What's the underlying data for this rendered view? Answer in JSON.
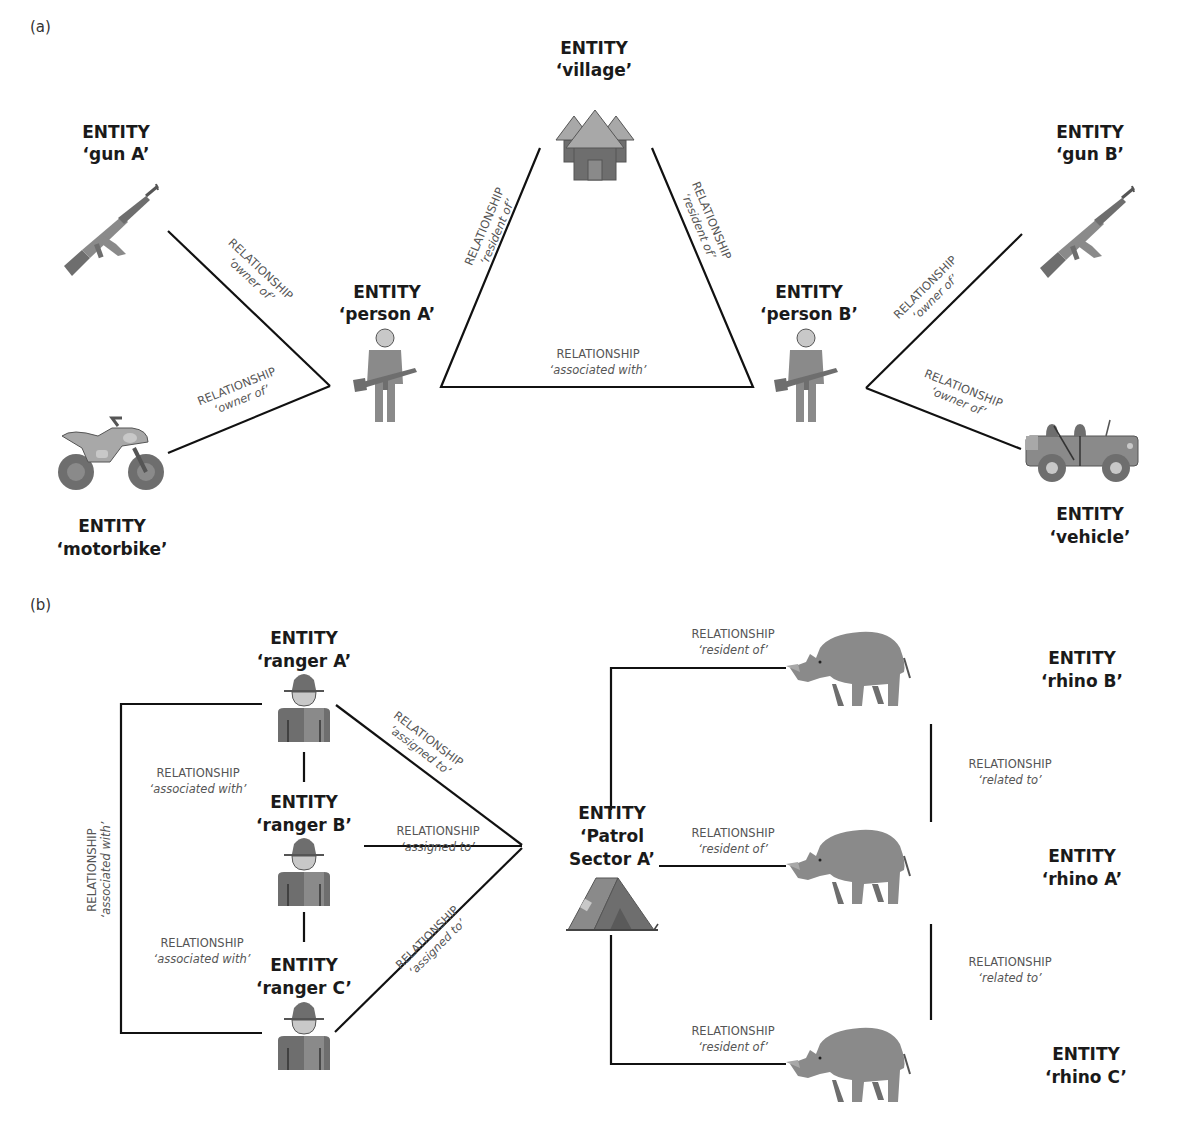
{
  "panels": {
    "a": {
      "label": "(a)",
      "entities": {
        "gun_a": {
          "type": "ENTITY",
          "name": "‘gun A’",
          "icon": "rifle-icon"
        },
        "village": {
          "type": "ENTITY",
          "name": "‘village’",
          "icon": "village-huts-icon"
        },
        "gun_b": {
          "type": "ENTITY",
          "name": "‘gun B’",
          "icon": "rifle-icon"
        },
        "person_a": {
          "type": "ENTITY",
          "name": "‘person A’",
          "icon": "armed-person-icon"
        },
        "person_b": {
          "type": "ENTITY",
          "name": "‘person B’",
          "icon": "armed-person-icon"
        },
        "motorbike": {
          "type": "ENTITY",
          "name": "‘motorbike’",
          "icon": "motorbike-icon"
        },
        "vehicle": {
          "type": "ENTITY",
          "name": "‘vehicle’",
          "icon": "jeep-icon"
        }
      },
      "relationships": [
        {
          "from": "person A",
          "to": "gun A",
          "label": "RELATIONSHIP",
          "value": "‘owner of’"
        },
        {
          "from": "person A",
          "to": "motorbike",
          "label": "RELATIONSHIP",
          "value": "‘owner of’"
        },
        {
          "from": "person A",
          "to": "village",
          "label": "RELATIONSHIP",
          "value": "‘resident of’"
        },
        {
          "from": "person B",
          "to": "village",
          "label": "RELATIONSHIP",
          "value": "‘resident of’"
        },
        {
          "from": "person A",
          "to": "person B",
          "label": "RELATIONSHIP",
          "value": "‘associated with’"
        },
        {
          "from": "person B",
          "to": "gun B",
          "label": "RELATIONSHIP",
          "value": "‘owner of’"
        },
        {
          "from": "person B",
          "to": "vehicle",
          "label": "RELATIONSHIP",
          "value": "‘owner of’"
        }
      ]
    },
    "b": {
      "label": "(b)",
      "entities": {
        "ranger_a": {
          "type": "ENTITY",
          "name": "‘ranger A’",
          "icon": "ranger-icon"
        },
        "ranger_b": {
          "type": "ENTITY",
          "name": "‘ranger B’",
          "icon": "ranger-icon"
        },
        "ranger_c": {
          "type": "ENTITY",
          "name": "‘ranger C’",
          "icon": "ranger-icon"
        },
        "patrol": {
          "type": "ENTITY",
          "name_line1": "‘Patrol",
          "name_line2": "Sector A’",
          "icon": "tent-icon"
        },
        "rhino_a": {
          "type": "ENTITY",
          "name": "‘rhino A’",
          "icon": "rhino-icon"
        },
        "rhino_b": {
          "type": "ENTITY",
          "name": "‘rhino B’",
          "icon": "rhino-icon"
        },
        "rhino_c": {
          "type": "ENTITY",
          "name": "‘rhino C’",
          "icon": "rhino-icon"
        }
      },
      "relationships": [
        {
          "from": "ranger A",
          "to": "ranger B",
          "label": "RELATIONSHIP",
          "value": "‘associated with’"
        },
        {
          "from": "ranger B",
          "to": "ranger C",
          "label": "RELATIONSHIP",
          "value": "‘associated with’"
        },
        {
          "from": "ranger A",
          "to": "ranger C",
          "label": "RELATIONSHIP",
          "value": "‘associated with’"
        },
        {
          "from": "ranger A",
          "to": "Patrol Sector A",
          "label": "RELATIONSHIP",
          "value": "‘assigned to’"
        },
        {
          "from": "ranger B",
          "to": "Patrol Sector A",
          "label": "RELATIONSHIP",
          "value": "‘assigned to’"
        },
        {
          "from": "ranger C",
          "to": "Patrol Sector A",
          "label": "RELATIONSHIP",
          "value": "‘assigned to’"
        },
        {
          "from": "rhino B",
          "to": "Patrol Sector A",
          "label": "RELATIONSHIP",
          "value": "‘resident of’"
        },
        {
          "from": "rhino A",
          "to": "Patrol Sector A",
          "label": "RELATIONSHIP",
          "value": "‘resident of’"
        },
        {
          "from": "rhino C",
          "to": "Patrol Sector A",
          "label": "RELATIONSHIP",
          "value": "‘resident of’"
        },
        {
          "from": "rhino B",
          "to": "rhino A",
          "label": "RELATIONSHIP",
          "value": "‘related to’"
        },
        {
          "from": "rhino A",
          "to": "rhino C",
          "label": "RELATIONSHIP",
          "value": "‘related to’"
        }
      ]
    }
  }
}
